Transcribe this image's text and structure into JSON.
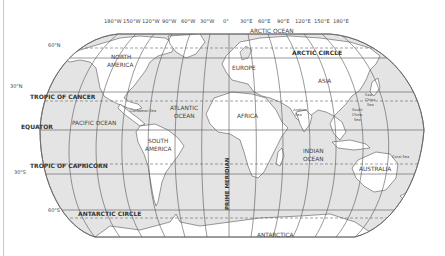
{
  "map": {
    "projection": "robinson",
    "colors": {
      "ocean": "#e4e4e4",
      "land": "#ffffff",
      "grid": "#555555",
      "outline": "#666666",
      "text": "#444444",
      "frame": "#c8c8c8"
    },
    "longitude_labels": [
      "180°W",
      "150°W",
      "120°W",
      "90°W",
      "60°W",
      "30°W",
      "0°",
      "30°E",
      "60°E",
      "90°E",
      "120°E",
      "150°E",
      "180°E"
    ],
    "latitude_labels": {
      "n60": "60°N",
      "n30": "30°N",
      "s30": "30°S",
      "s60": "60°S"
    },
    "special_lines": {
      "arctic_circle": "ARCTIC CIRCLE",
      "tropic_of_cancer": "TROPIC OF CANCER",
      "equator": "EQUATOR",
      "tropic_of_capricorn": "TROPIC OF CAPRICORN",
      "antarctic_circle": "ANTARCTIC CIRCLE",
      "prime_meridian": "PRIME MERIDIAN"
    },
    "continents": {
      "north_america_1": "NORTH",
      "north_america_2": "AMERICA",
      "south_america_1": "SOUTH",
      "south_america_2": "AMERICA",
      "europe": "EUROPE",
      "asia": "ASIA",
      "africa": "AFRICA",
      "australia": "AUSTRALIA",
      "antarctica": "ANTARCTICA"
    },
    "oceans": {
      "arctic": "ARCTIC OCEAN",
      "pacific": "PACIFIC OCEAN",
      "atlantic_1": "ATLANTIC",
      "atlantic_2": "OCEAN",
      "indian_1": "INDIAN",
      "indian_2": "OCEAN"
    },
    "seas": {
      "caribbean": "Caribbean Sea",
      "arabian_1": "Arabian",
      "arabian_2": "Sea",
      "east_china_1": "East",
      "east_china_2": "China",
      "east_china_3": "Sea",
      "south_china_1": "South",
      "south_china_2": "China",
      "south_china_3": "Sea",
      "coral": "Coral Sea"
    }
  }
}
